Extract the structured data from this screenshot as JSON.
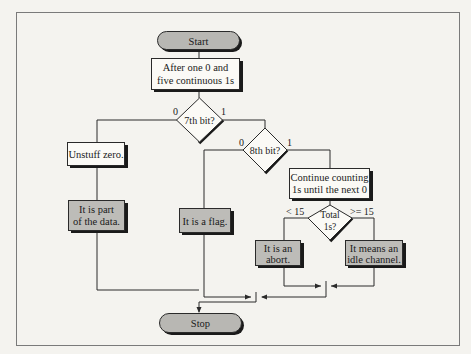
{
  "diagram": {
    "type": "flowchart",
    "colors": {
      "background": "#f4f3ef",
      "frame": "#7a7a7a",
      "box_white": "#fbfaf6",
      "box_shaded": "#bdbcb8",
      "terminal": "#b8b7b3",
      "shadow": "#1a1a1a",
      "line": "#2a2a2a"
    },
    "nodes": {
      "start": {
        "label": "Start"
      },
      "after_zero": {
        "line1": "After one 0 and",
        "line2": "five continuous 1s"
      },
      "seventh_bit": {
        "label": "7th bit?"
      },
      "unstuff": {
        "label": "Unstuff zero."
      },
      "part_of_data": {
        "line1": "It is part",
        "line2": "of the data."
      },
      "eighth_bit": {
        "label": "8th bit?"
      },
      "flag": {
        "label": "It is a flag."
      },
      "continue_counting": {
        "line1": "Continue counting",
        "line2": "1s until the next 0"
      },
      "total_ones": {
        "line1": "Total",
        "line2": "1s?"
      },
      "abort": {
        "line1": "It is an",
        "line2": "abort."
      },
      "idle": {
        "line1": "It means an",
        "line2": "idle channel."
      },
      "stop": {
        "label": "Stop"
      }
    },
    "branches": {
      "seventh_zero": "0",
      "seventh_one": "1",
      "eighth_zero": "0",
      "eighth_one": "1",
      "total_less": "< 15",
      "total_ge": ">= 15"
    }
  }
}
